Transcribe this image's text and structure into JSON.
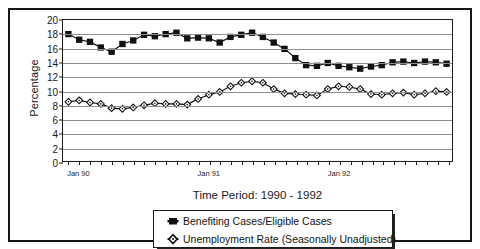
{
  "figure": {
    "y_axis_title": "Percentage",
    "x_axis_title": "Time Period: 1990 - 1992"
  },
  "legend": {
    "items": [
      {
        "label": "Benefiting Cases/Eligible Cases",
        "marker": "filled-square-marker",
        "color": "#111111"
      },
      {
        "label": "Unemployment Rate (Seasonally Unadjusted)",
        "marker": "open-diamond-marker",
        "color": "#111111"
      }
    ]
  },
  "chart_data": {
    "type": "line",
    "title": "",
    "subtitle": "",
    "xlabel": "Time Period: 1990 - 1992",
    "ylabel": "Percentage",
    "ylim": [
      0,
      20
    ],
    "ytick_step": 2,
    "yticks": [
      0,
      2,
      4,
      6,
      8,
      10,
      12,
      14,
      16,
      18,
      20
    ],
    "grid": true,
    "legend_position": "bottom-center",
    "xtick_labels": [
      "Jan 90",
      "Jan 91",
      "Jan 92"
    ],
    "xtick_label_indices": [
      0,
      12,
      24
    ],
    "x": [
      "Jan 90",
      "Feb 90",
      "Mar 90",
      "Apr 90",
      "May 90",
      "Jun 90",
      "Jul 90",
      "Aug 90",
      "Sep 90",
      "Oct 90",
      "Nov 90",
      "Dec 90",
      "Jan 91",
      "Feb 91",
      "Mar 91",
      "Apr 91",
      "May 91",
      "Jun 91",
      "Jul 91",
      "Aug 91",
      "Sep 91",
      "Oct 91",
      "Nov 91",
      "Dec 91",
      "Jan 92",
      "Feb 92",
      "Mar 92",
      "Apr 92",
      "May 92",
      "Jun 92",
      "Jul 92",
      "Aug 92",
      "Sep 92",
      "Oct 92",
      "Nov 92",
      "Dec 92"
    ],
    "series": [
      {
        "name": "Benefiting Cases/Eligible Cases",
        "marker": "filled-square",
        "color": "#111111",
        "values": [
          18.0,
          17.2,
          16.9,
          16.1,
          15.5,
          16.6,
          17.1,
          17.9,
          17.7,
          18.0,
          18.2,
          17.4,
          17.5,
          17.4,
          16.8,
          17.6,
          17.9,
          18.2,
          17.6,
          16.8,
          15.9,
          14.6,
          13.6,
          13.5,
          13.9,
          13.5,
          13.3,
          13.1,
          13.4,
          13.6,
          14.0,
          14.1,
          13.9,
          14.1,
          14.0,
          13.8
        ]
      },
      {
        "name": "Unemployment Rate (Seasonally Unadjusted)",
        "marker": "open-diamond",
        "color": "#111111",
        "values": [
          8.4,
          8.6,
          8.3,
          8.1,
          7.5,
          7.4,
          7.6,
          7.9,
          8.2,
          8.1,
          8.1,
          8.0,
          8.8,
          9.4,
          9.8,
          10.6,
          11.1,
          11.3,
          11.1,
          10.2,
          9.6,
          9.5,
          9.4,
          9.3,
          10.2,
          10.6,
          10.5,
          10.2,
          9.5,
          9.4,
          9.6,
          9.7,
          9.4,
          9.6,
          9.9,
          9.8
        ]
      }
    ]
  }
}
